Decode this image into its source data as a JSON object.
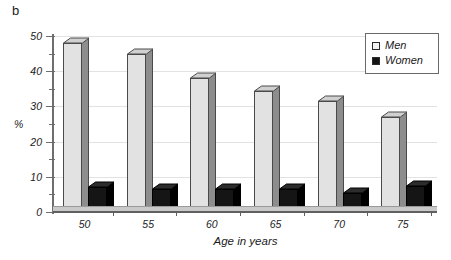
{
  "panel": {
    "label": "b"
  },
  "axes": {
    "y_title": "%",
    "x_title": "Age in years",
    "y_ticks": [
      0,
      10,
      20,
      30,
      40,
      50
    ],
    "y_minor_ticks": [
      5,
      15,
      25,
      35,
      45
    ],
    "x_ticks": [
      "50",
      "55",
      "60",
      "65",
      "70",
      "75"
    ]
  },
  "legend": {
    "items": [
      {
        "label": "Men",
        "color": "#f2f2f2",
        "swatch": "men-swatch"
      },
      {
        "label": "Women",
        "color": "#141414",
        "swatch": "women-swatch"
      }
    ]
  },
  "chart_data": {
    "type": "bar",
    "title": "",
    "subtitle": "",
    "panel_label": "b",
    "categories": [
      "50",
      "55",
      "60",
      "65",
      "70",
      "75"
    ],
    "series": [
      {
        "name": "Men",
        "color": "#e2e2e2",
        "values": [
          48,
          45,
          38,
          34.5,
          31.5,
          27
        ]
      },
      {
        "name": "Women",
        "color": "#151515",
        "values": [
          7,
          6.5,
          6.5,
          6.5,
          5.5,
          7.5
        ]
      }
    ],
    "xlabel": "Age in years",
    "ylabel": "%",
    "ylim": [
      0,
      50
    ],
    "yticks": [
      0,
      10,
      20,
      30,
      40,
      50
    ],
    "grid": true,
    "legend_position": "top-right",
    "style": "3d-bars"
  }
}
